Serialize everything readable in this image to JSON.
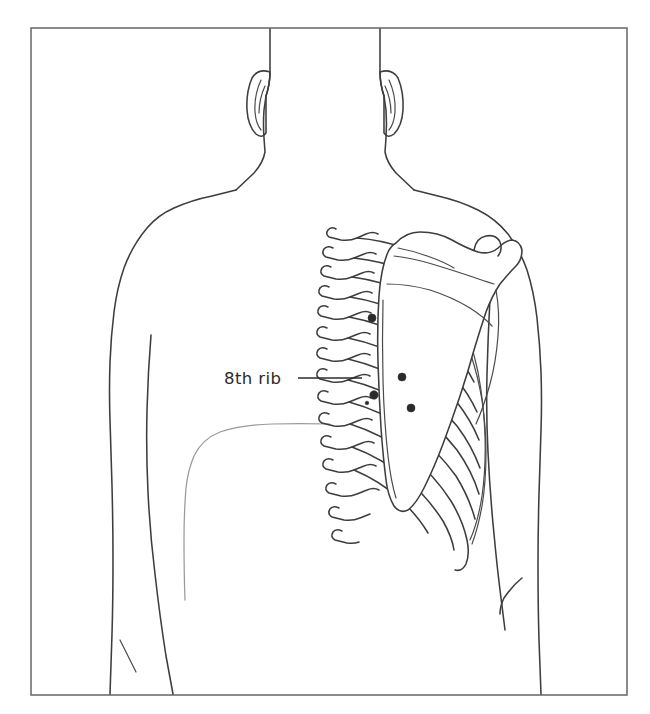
{
  "figure": {
    "domain_kind": "anatomical-illustration",
    "view": "posterior",
    "background_color": "#ffffff",
    "line_color": "#3d3d3d",
    "faint_line_color": "#9a9a9a",
    "frame_color": "#6f6f6f",
    "marker_color": "#2b2b2b"
  },
  "frame": {
    "x": 31,
    "y": 28,
    "width": 596,
    "height": 667
  },
  "labels": [
    {
      "id": "eighth-rib",
      "text": "8th rib",
      "text_x": 224,
      "text_y": 384,
      "leader_x1": 298,
      "leader_y1": 378,
      "leader_x2": 362,
      "leader_y2": 378
    }
  ],
  "markers": [
    {
      "id": "marker-1",
      "cx": 372,
      "cy": 318,
      "r": 4.0
    },
    {
      "id": "marker-2",
      "cx": 402,
      "cy": 377,
      "r": 4.0
    },
    {
      "id": "marker-3",
      "cx": 374,
      "cy": 395,
      "r": 4.2
    },
    {
      "id": "marker-4",
      "cx": 367,
      "cy": 403,
      "r": 1.8
    },
    {
      "id": "marker-5",
      "cx": 411,
      "cy": 408,
      "r": 4.0
    }
  ],
  "structures": [
    {
      "id": "head-neck-left",
      "name": "left-head-neck-outline"
    },
    {
      "id": "head-neck-right",
      "name": "right-head-neck-outline"
    },
    {
      "id": "ear-left",
      "name": "left-ear"
    },
    {
      "id": "ear-right",
      "name": "right-ear"
    },
    {
      "id": "torso-left",
      "name": "left-torso-outline"
    },
    {
      "id": "torso-right",
      "name": "right-torso-outline"
    },
    {
      "id": "arm-left",
      "name": "left-arm-outline"
    },
    {
      "id": "arm-right",
      "name": "right-arm-outline"
    },
    {
      "id": "vertebral-column",
      "name": "thoracic-vertebrae-spinous-processes"
    },
    {
      "id": "ribcage",
      "name": "right-ribcage-posterior"
    },
    {
      "id": "scapula",
      "name": "right-scapula"
    },
    {
      "id": "contour-faint",
      "name": "left-scapula-inferior-contour"
    }
  ]
}
